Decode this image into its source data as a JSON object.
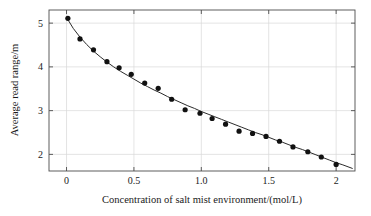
{
  "chart_data": {
    "type": "scatter",
    "title": "",
    "subtitle": "",
    "xlabel": "Concentration of salt mist environment/(mol/L)",
    "ylabel": "Average read range/m",
    "xlim": [
      -0.13,
      2.14
    ],
    "ylim": [
      1.62,
      5.3
    ],
    "xticks": [
      0,
      0.5,
      1.0,
      1.5,
      2
    ],
    "xtick_labels": [
      "0",
      "0.5",
      "1.0",
      "1.5",
      "2"
    ],
    "yticks": [
      2,
      3,
      4,
      5
    ],
    "ytick_labels": [
      "2",
      "3",
      "4",
      "5"
    ],
    "grid": true,
    "legend": "none",
    "series": [
      {
        "name": "Measured average read range",
        "marker": "filled-circle",
        "color": "#111111",
        "x": [
          0.01,
          0.1,
          0.2,
          0.3,
          0.39,
          0.48,
          0.58,
          0.68,
          0.78,
          0.88,
          0.99,
          1.08,
          1.18,
          1.28,
          1.38,
          1.48,
          1.58,
          1.68,
          1.79,
          1.89,
          2.0
        ],
        "y": [
          5.11,
          4.64,
          4.39,
          4.12,
          3.98,
          3.83,
          3.63,
          3.51,
          3.26,
          3.02,
          2.94,
          2.82,
          2.69,
          2.53,
          2.48,
          2.41,
          2.3,
          2.17,
          2.06,
          1.94,
          1.77
        ]
      },
      {
        "name": "Fitted curve",
        "marker": "none",
        "color": "#2b2b2b",
        "x": [
          0.0,
          0.05,
          0.1,
          0.15,
          0.2,
          0.25,
          0.3,
          0.35,
          0.4,
          0.45,
          0.5,
          0.55,
          0.6,
          0.65,
          0.7,
          0.75,
          0.8,
          0.85,
          0.9,
          0.95,
          1.0,
          1.05,
          1.1,
          1.15,
          1.2,
          1.25,
          1.3,
          1.35,
          1.4,
          1.45,
          1.5,
          1.55,
          1.6,
          1.65,
          1.7,
          1.75,
          1.8,
          1.85,
          1.9,
          1.95,
          2.0,
          2.05,
          2.12
        ],
        "y": [
          5.13,
          4.88,
          4.68,
          4.51,
          4.36,
          4.23,
          4.11,
          4.0,
          3.9,
          3.81,
          3.72,
          3.63,
          3.55,
          3.47,
          3.4,
          3.32,
          3.25,
          3.18,
          3.11,
          3.05,
          2.98,
          2.92,
          2.86,
          2.8,
          2.74,
          2.68,
          2.62,
          2.56,
          2.5,
          2.45,
          2.39,
          2.33,
          2.28,
          2.22,
          2.16,
          2.11,
          2.05,
          1.99,
          1.93,
          1.87,
          1.81,
          1.76,
          1.68
        ]
      }
    ]
  },
  "figure": {
    "background_color": "#ffffff",
    "frame_color": "#4d4d4d",
    "grid_color": "#d8d8d8"
  }
}
